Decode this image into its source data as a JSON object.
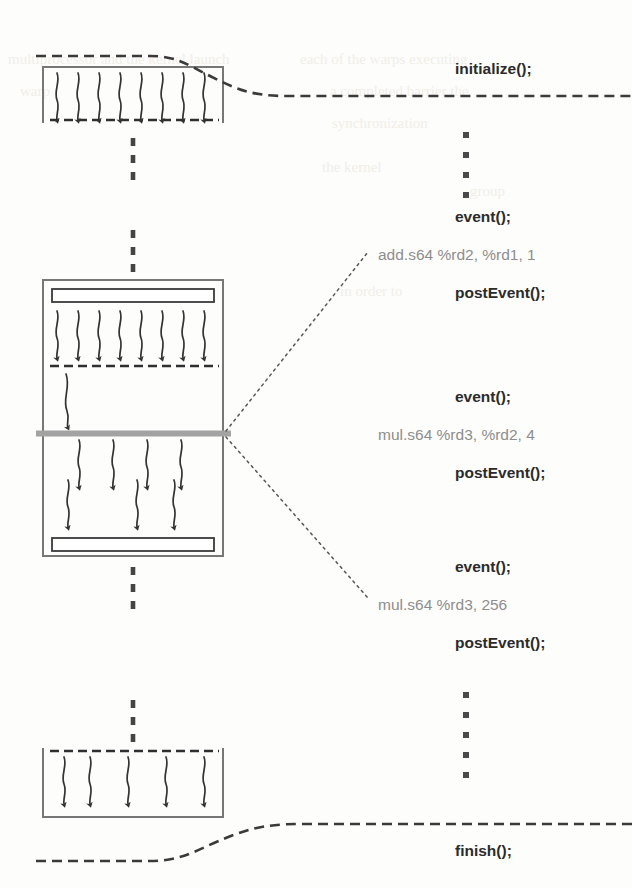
{
  "figure": {
    "colors": {
      "ink": "#3a3a3a",
      "ink_light": "#6f6f6f",
      "gray_bar": "#a3a3a3",
      "asm_text": "#8d8d8d",
      "api_text": "#2b2b2b",
      "background": "#fdfdfc"
    }
  },
  "timeline": {
    "entries": [
      {
        "id": "initialize",
        "label": "initialize();",
        "kind": "api",
        "x": 455,
        "y": 70
      },
      {
        "id": "ellipsis-top",
        "label": "",
        "kind": "ellipsis",
        "x": 466,
        "y": 128,
        "dots": 4
      },
      {
        "id": "event-1",
        "label": "event();",
        "kind": "api",
        "x": 455,
        "y": 218
      },
      {
        "id": "asm-1",
        "label": "add.s64 %rd2, %rd1, 1",
        "kind": "asm",
        "x": 378,
        "y": 256
      },
      {
        "id": "postevent-1",
        "label": "postEvent();",
        "kind": "api",
        "x": 455,
        "y": 294
      },
      {
        "id": "event-2",
        "label": "event();",
        "kind": "api",
        "x": 455,
        "y": 398
      },
      {
        "id": "asm-2",
        "label": "mul.s64 %rd3, %rd2, 4",
        "kind": "asm",
        "x": 378,
        "y": 436
      },
      {
        "id": "postevent-2",
        "label": "postEvent();",
        "kind": "api",
        "x": 455,
        "y": 474
      },
      {
        "id": "event-3",
        "label": "event();",
        "kind": "api",
        "x": 455,
        "y": 568
      },
      {
        "id": "asm-3",
        "label": "mul.s64 %rd3, 256",
        "kind": "asm",
        "x": 378,
        "y": 606
      },
      {
        "id": "postevent-3",
        "label": "postEvent();",
        "kind": "api",
        "x": 455,
        "y": 644
      },
      {
        "id": "ellipsis-bottom",
        "label": "",
        "kind": "ellipsis",
        "x": 466,
        "y": 690,
        "dots": 5
      },
      {
        "id": "finish",
        "label": "finish();",
        "kind": "api",
        "x": 455,
        "y": 852
      }
    ]
  },
  "blocks": [
    {
      "id": "block-top",
      "name": "first-kernel-block",
      "rect": {
        "x": 43,
        "y": 67,
        "w": 180,
        "h": 56
      },
      "open_top": false,
      "open_bottom": true,
      "inner_bars": [],
      "barriers": [
        {
          "y": 120,
          "style": "dashed"
        }
      ],
      "arrow_groups": [
        {
          "count": 8,
          "from_y": 74,
          "to_y": 119,
          "x_start": 55,
          "x_step": 21
        }
      ]
    },
    {
      "id": "block-middle",
      "name": "second-kernel-block",
      "rect": {
        "x": 43,
        "y": 280,
        "w": 180,
        "h": 276
      },
      "open_top": false,
      "open_bottom": false,
      "inner_bars": [
        {
          "x": 52,
          "y": 289,
          "w": 162,
          "h": 13
        },
        {
          "x": 52,
          "y": 538,
          "w": 162,
          "h": 13
        }
      ],
      "barriers": [
        {
          "y": 366,
          "style": "dashed"
        },
        {
          "y": 433,
          "style": "gray-solid"
        }
      ],
      "arrow_groups": [
        {
          "count": 8,
          "from_y": 310,
          "to_y": 364,
          "x_start": 55,
          "x_step": 21
        },
        {
          "count": 1,
          "from_y": 374,
          "to_y": 428,
          "x_start": 66,
          "x_step": 0
        },
        {
          "count": 4,
          "from_y": 440,
          "to_y": 495,
          "x_start": 77,
          "x_step": 34
        },
        {
          "count": 3,
          "from_y": 478,
          "to_y": 534,
          "x_start": 66,
          "x_step": 47
        }
      ]
    },
    {
      "id": "block-bottom",
      "name": "third-kernel-block",
      "rect": {
        "x": 43,
        "y": 748,
        "w": 180,
        "h": 69
      },
      "open_top": true,
      "open_bottom": false,
      "inner_bars": [],
      "barriers": [
        {
          "y": 751,
          "style": "dashed"
        }
      ],
      "arrow_groups": [
        {
          "count": 5,
          "from_y": 757,
          "to_y": 812,
          "x_start": 62,
          "x_step": 34
        }
      ]
    }
  ],
  "connectors": {
    "vertical_dashes": [
      {
        "id": "dash-top-to-middle-a",
        "x": 133,
        "y1": 136,
        "y2": 180
      },
      {
        "id": "dash-top-to-middle-b",
        "x": 133,
        "y1": 228,
        "y2": 274
      },
      {
        "id": "dash-middle-to-bottom",
        "x": 133,
        "y1": 565,
        "y2": 615
      },
      {
        "id": "dash-bottom-entry",
        "x": 133,
        "y1": 698,
        "y2": 742
      }
    ],
    "callouts": [
      {
        "id": "callout-upper",
        "from_x": 224,
        "from_y": 432,
        "to_x": 365,
        "to_y": 252
      },
      {
        "id": "callout-lower",
        "from_x": 224,
        "from_y": 436,
        "to_x": 365,
        "to_y": 600
      }
    ],
    "timeline_links": [
      {
        "id": "link-initialize",
        "name": "initialize-timeline-link"
      },
      {
        "id": "link-finish",
        "name": "finish-timeline-link"
      }
    ]
  },
  "scan_artifacts": {
    "note": "faint bleed-through text from reverse page",
    "lines": [
      {
        "text": "multiprocessor and the kernel launch",
        "x": 8,
        "y": 64
      },
      {
        "text": "each of the warps executing",
        "x": 300,
        "y": 64
      },
      {
        "text": "a completed barrier the",
        "x": 330,
        "y": 96
      },
      {
        "text": "synchronization",
        "x": 330,
        "y": 128
      },
      {
        "text": "the kernel",
        "x": 320,
        "y": 172
      },
      {
        "text": "in order to",
        "x": 340,
        "y": 296
      }
    ]
  }
}
